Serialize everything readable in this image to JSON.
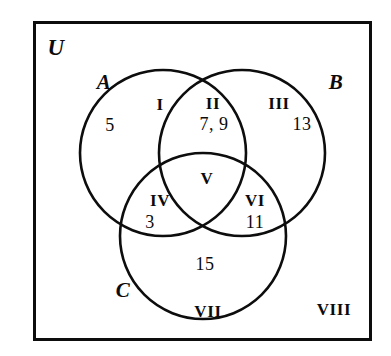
{
  "figure": {
    "type": "venn-diagram-3-set",
    "universe_label": "U",
    "background_color": "#ffffff",
    "line_color": "#0d0d0d",
    "text_color": "#0b0b0b"
  },
  "sets": [
    {
      "id": "A",
      "label": "A",
      "cx": 163,
      "cy": 153,
      "r": 83,
      "label_x": 104,
      "label_y": 82
    },
    {
      "id": "B",
      "label": "B",
      "cx": 242,
      "cy": 153,
      "r": 83,
      "label_x": 336,
      "label_y": 82
    },
    {
      "id": "C",
      "label": "C",
      "cx": 203,
      "cy": 236,
      "r": 83,
      "label_x": 123,
      "label_y": 290
    }
  ],
  "regions": [
    {
      "id": "I",
      "roman": "I",
      "roman_x": 160,
      "roman_y": 104,
      "elements": "",
      "elements_x": 0,
      "elements_y": 0,
      "description": "A only (upper part)"
    },
    {
      "id": "II",
      "roman": "II",
      "roman_x": 213,
      "roman_y": 103,
      "elements": "7, 9",
      "elements_x": 214,
      "elements_y": 124,
      "description": "A and B only"
    },
    {
      "id": "III",
      "roman": "III",
      "roman_x": 279,
      "roman_y": 103,
      "elements": "13",
      "elements_x": 302,
      "elements_y": 124,
      "description": "B only"
    },
    {
      "id": "IV",
      "roman": "IV",
      "roman_x": 160,
      "roman_y": 200,
      "elements": "3",
      "elements_x": 150,
      "elements_y": 222,
      "description": "A and C only"
    },
    {
      "id": "V",
      "roman": "V",
      "roman_x": 207,
      "roman_y": 178,
      "elements": "",
      "elements_x": 0,
      "elements_y": 0,
      "description": "A and B and C"
    },
    {
      "id": "VI",
      "roman": "VI",
      "roman_x": 255,
      "roman_y": 200,
      "elements": "11",
      "elements_x": 255,
      "elements_y": 222,
      "description": "B and C only"
    },
    {
      "id": "VII",
      "roman": "VII",
      "roman_x": 208,
      "roman_y": 311,
      "elements": "15",
      "elements_x": 205,
      "elements_y": 264,
      "description": "C only"
    },
    {
      "id": "VIII",
      "roman": "VIII",
      "roman_x": 334,
      "roman_y": 309,
      "elements": "",
      "elements_x": 0,
      "elements_y": 0,
      "description": "outside all three sets"
    }
  ],
  "extra_numbers": [
    {
      "id": "A-only-5",
      "value": "5",
      "x": 110,
      "y": 125,
      "region": "I"
    }
  ],
  "universe": {
    "label": "U",
    "label_x": 56,
    "label_y": 47
  }
}
